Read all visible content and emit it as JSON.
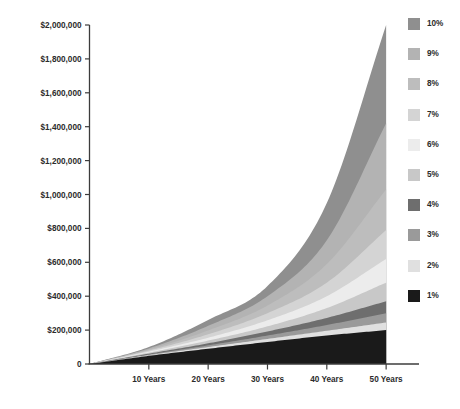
{
  "chart_data": {
    "type": "area",
    "title": "",
    "subtitle": "",
    "xlabel": "",
    "ylabel": "",
    "x": [
      0,
      10,
      20,
      30,
      40,
      50
    ],
    "x_tick_labels": [
      "10 Years",
      "20 Years",
      "30 Years",
      "40 Years",
      "50 Years"
    ],
    "x_tick_values": [
      10,
      20,
      30,
      40,
      50
    ],
    "xlim": [
      0,
      52
    ],
    "ylim": [
      0,
      2000000
    ],
    "y_tick_labels": [
      "$2,000,000",
      "$1,800,000",
      "$1,600,000",
      "$1,400,000",
      "$1,200,000",
      "$1,000,000",
      "$800,000",
      "$600,000",
      "$400,000",
      "$200,000",
      "0"
    ],
    "y_tick_values": [
      2000000,
      1800000,
      1600000,
      1400000,
      1200000,
      1000000,
      800000,
      600000,
      400000,
      200000,
      0
    ],
    "grid": false,
    "legend_position": "right",
    "stacked": false,
    "note": "Cumulative savings growth curves, one filled band per annual interest rate. Bands are overlaid so each curve's fill is visible between it and the next lower rate curve.",
    "series": [
      {
        "name": "10%",
        "color": "#8f8f8f",
        "values": [
          0,
          100000,
          260000,
          460000,
          950000,
          2000000
        ]
      },
      {
        "name": "9%",
        "color": "#b3b3b3",
        "values": [
          0,
          92000,
          225000,
          400000,
          730000,
          1420000
        ]
      },
      {
        "name": "8%",
        "color": "#bdbdbd",
        "values": [
          0,
          85000,
          198000,
          345000,
          590000,
          1030000
        ]
      },
      {
        "name": "7%",
        "color": "#d4d4d4",
        "values": [
          0,
          79000,
          175000,
          300000,
          480000,
          790000
        ]
      },
      {
        "name": "6%",
        "color": "#ececec",
        "values": [
          0,
          73000,
          155000,
          258000,
          400000,
          620000
        ]
      },
      {
        "name": "5%",
        "color": "#c8c8c8",
        "values": [
          0,
          67000,
          138000,
          222000,
          330000,
          480000
        ]
      },
      {
        "name": "4%",
        "color": "#6e6e6e",
        "values": [
          0,
          61000,
          122000,
          192000,
          272000,
          370000
        ]
      },
      {
        "name": "3%",
        "color": "#9a9a9a",
        "values": [
          0,
          56000,
          110000,
          168000,
          230000,
          300000
        ]
      },
      {
        "name": "2%",
        "color": "#e0e0e0",
        "values": [
          0,
          52000,
          100000,
          148000,
          196000,
          245000
        ]
      },
      {
        "name": "1%",
        "color": "#1a1a1a",
        "values": [
          0,
          48000,
          90000,
          130000,
          168000,
          200000
        ]
      }
    ]
  },
  "legend": {
    "items": [
      {
        "label": "10%",
        "color": "#8f8f8f"
      },
      {
        "label": "9%",
        "color": "#b3b3b3"
      },
      {
        "label": "8%",
        "color": "#bdbdbd"
      },
      {
        "label": "7%",
        "color": "#d4d4d4"
      },
      {
        "label": "6%",
        "color": "#ececec"
      },
      {
        "label": "5%",
        "color": "#c8c8c8"
      },
      {
        "label": "4%",
        "color": "#6e6e6e"
      },
      {
        "label": "3%",
        "color": "#9a9a9a"
      },
      {
        "label": "2%",
        "color": "#e0e0e0"
      },
      {
        "label": "1%",
        "color": "#1a1a1a"
      }
    ]
  },
  "axes": {
    "axis_color": "#3c3c3c",
    "label_color": "#2b2b2b"
  }
}
